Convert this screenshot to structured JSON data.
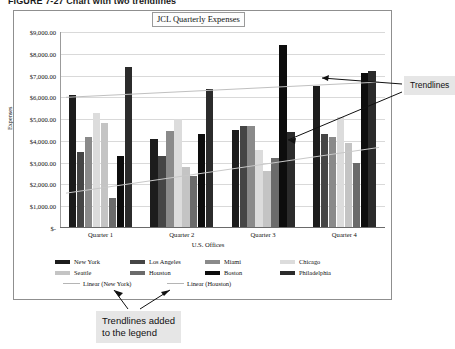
{
  "figure": {
    "caption": "FIGURE 7-27  Chart with two trendlines"
  },
  "chart_data": {
    "type": "bar",
    "title": "JCL Quarterly Expenses",
    "xlabel": "U.S. Offices",
    "ylabel": "Expenses",
    "categories": [
      "Quarter 1",
      "Quarter 2",
      "Quarter 3",
      "Quarter 4"
    ],
    "ylim": [
      0,
      9000
    ],
    "ytick_labels": [
      "$9,000.00",
      "$8,000.00",
      "$7,000.00",
      "$6,000.00",
      "$5,000.00",
      "$4,000.00",
      "$3,000.00",
      "$2,000.00",
      "$1,000.00",
      "$-"
    ],
    "ytick_values": [
      9000,
      8000,
      7000,
      6000,
      5000,
      4000,
      3000,
      2000,
      1000,
      0
    ],
    "grid": true,
    "legend_position": "bottom",
    "series": [
      {
        "name": "New York",
        "color": "#1c1c1c",
        "values": [
          6100,
          4100,
          4500,
          6500
        ]
      },
      {
        "name": "Los Angeles",
        "color": "#454545",
        "values": [
          3500,
          3300,
          4700,
          4300
        ]
      },
      {
        "name": "Miami",
        "color": "#8a8a8a",
        "values": [
          4200,
          4450,
          4700,
          4200
        ]
      },
      {
        "name": "Chicago",
        "color": "#dcdcdc",
        "values": [
          5300,
          5000,
          3600,
          5100
        ]
      },
      {
        "name": "Seattle",
        "color": "#c4c4c4",
        "values": [
          4800,
          2800,
          2600,
          3900
        ]
      },
      {
        "name": "Houston",
        "color": "#6b6b6b",
        "values": [
          1400,
          2400,
          3200,
          3000
        ]
      },
      {
        "name": "Boston",
        "color": "#0d0d0d",
        "values": [
          3300,
          4300,
          8400,
          7100
        ]
      },
      {
        "name": "Philadelphia",
        "color": "#2b2b2b",
        "values": [
          7400,
          6400,
          4400,
          7200
        ]
      }
    ],
    "trendlines": [
      {
        "name": "Linear (New York)",
        "color": "#c0c0c0",
        "start": 6000,
        "end": 6700
      },
      {
        "name": "Linear (Houston)",
        "color": "#c8c8c8",
        "start": 1600,
        "end": 3700
      }
    ],
    "legend_entries": [
      {
        "label": "New York",
        "color": "#1c1c1c",
        "kind": "box"
      },
      {
        "label": "Los Angeles",
        "color": "#454545",
        "kind": "box"
      },
      {
        "label": "Miami",
        "color": "#8a8a8a",
        "kind": "box"
      },
      {
        "label": "Chicago",
        "color": "#dcdcdc",
        "kind": "box"
      },
      {
        "label": "Seattle",
        "color": "#c4c4c4",
        "kind": "box"
      },
      {
        "label": "Houston",
        "color": "#6b6b6b",
        "kind": "box"
      },
      {
        "label": "Boston",
        "color": "#0d0d0d",
        "kind": "box"
      },
      {
        "label": "Philadelphia",
        "color": "#2b2b2b",
        "kind": "box"
      },
      {
        "label": "Linear (New York)",
        "color": "#b5b5b5",
        "kind": "line"
      },
      {
        "label": "Linear (Houston)",
        "color": "#b5b5b5",
        "kind": "line"
      }
    ]
  },
  "annotations": {
    "right": "Trendlines",
    "bottom_line1": "Trendlines added",
    "bottom_line2": "to the legend"
  }
}
